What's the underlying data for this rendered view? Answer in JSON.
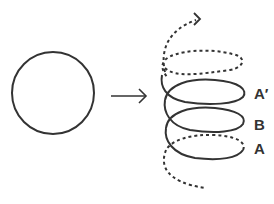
{
  "diagram": {
    "colors": {
      "stroke": "#333333",
      "background": "#ffffff"
    },
    "elements": {
      "circle": {
        "cx": 53,
        "cy": 93,
        "r": 41
      },
      "arrow": {
        "from": [
          111,
          96
        ],
        "to": [
          146,
          96
        ]
      },
      "helix_labels": [
        {
          "text": "A′",
          "x": 254,
          "y": 99
        },
        {
          "text": "B",
          "x": 254,
          "y": 130
        },
        {
          "text": "A",
          "x": 254,
          "y": 154
        }
      ]
    }
  }
}
